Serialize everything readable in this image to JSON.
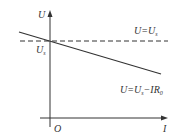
{
  "diagram": {
    "type": "U-I graph",
    "axes": {
      "y_label": "U",
      "x_label": "I",
      "origin_label": "O"
    },
    "intercept_label": {
      "main": "U",
      "sub": "s"
    },
    "lines": [
      {
        "name": "dashed-line",
        "label_main": "U=U",
        "label_sub": "s",
        "style": "dashed"
      },
      {
        "name": "sloped-line",
        "label_main": "U=U",
        "label_sub1": "s",
        "label_mid": "−IR",
        "label_sub2": "0",
        "style": "solid"
      }
    ],
    "colors": {
      "line": "#333333"
    }
  }
}
